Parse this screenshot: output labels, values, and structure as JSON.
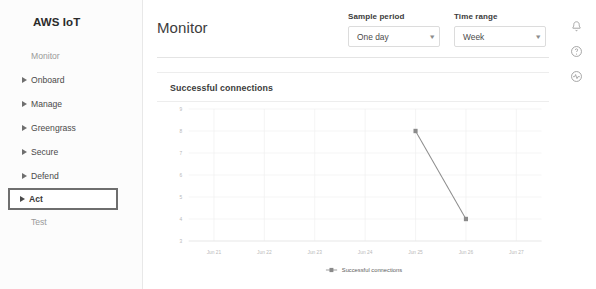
{
  "sidebar": {
    "brand": "AWS IoT",
    "items": [
      {
        "label": "Monitor",
        "caret": false,
        "muted": true,
        "highlight": false
      },
      {
        "label": "Onboard",
        "caret": true,
        "muted": false,
        "highlight": false
      },
      {
        "label": "Manage",
        "caret": true,
        "muted": false,
        "highlight": false
      },
      {
        "label": "Greengrass",
        "caret": true,
        "muted": false,
        "highlight": false
      },
      {
        "label": "Secure",
        "caret": true,
        "muted": false,
        "highlight": false
      },
      {
        "label": "Defend",
        "caret": true,
        "muted": false,
        "highlight": false
      },
      {
        "label": "Act",
        "caret": true,
        "muted": false,
        "highlight": true
      },
      {
        "label": "Test",
        "caret": false,
        "muted": true,
        "highlight": false
      }
    ]
  },
  "header": {
    "title": "Monitor",
    "sample_period": {
      "label": "Sample period",
      "value": "One day",
      "caret": "▾"
    },
    "time_range": {
      "label": "Time range",
      "value": "Week",
      "caret": "▾"
    },
    "icons": [
      "bell-icon",
      "help-circle-icon",
      "activity-circle-icon"
    ]
  },
  "card": {
    "title": "Successful connections"
  },
  "chart_data": {
    "type": "line",
    "title": "Successful connections",
    "xlabel": "",
    "ylabel": "",
    "x": [
      "Jun 21",
      "Jun 22",
      "Jun 23",
      "Jun 24",
      "Jun 25",
      "Jun 26",
      "Jun 27"
    ],
    "y_ticks": [
      9,
      8,
      7,
      6,
      5,
      4,
      3
    ],
    "ylim": [
      3,
      9
    ],
    "grid": true,
    "legend": [
      "Successful connections"
    ],
    "legend_position": "bottom-center",
    "series": [
      {
        "name": "Successful connections",
        "color": "#8c8c8c",
        "marker": "square",
        "points": [
          {
            "x": "Jun 25",
            "y": 8
          },
          {
            "x": "Jun 26",
            "y": 4
          }
        ]
      }
    ]
  },
  "colors": {
    "line": "#9a9a9a",
    "marker": "#8a8a8a",
    "grid": "#f0f0f0",
    "tick_text": "#b9b9b9",
    "highlight_border": "#6e6e6e"
  }
}
